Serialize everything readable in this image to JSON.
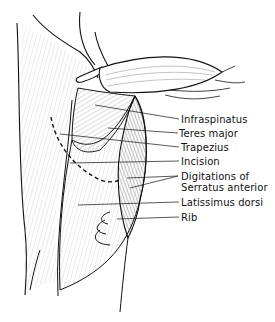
{
  "figure": {
    "labels": [
      {
        "id": "infraspinatus",
        "text": "Infraspinatus",
        "x": 181,
        "y": 114
      },
      {
        "id": "teres-major",
        "text": "Teres major",
        "x": 179,
        "y": 128
      },
      {
        "id": "trapezius",
        "text": "Trapezius",
        "x": 181,
        "y": 142
      },
      {
        "id": "incision",
        "text": "Incision",
        "x": 181,
        "y": 156
      },
      {
        "id": "digitations-1",
        "text": "Digitations of",
        "x": 181,
        "y": 171
      },
      {
        "id": "digitations-2",
        "text": "Serratus anterior",
        "x": 181,
        "y": 182
      },
      {
        "id": "latissimus",
        "text": "Latissimus dorsi",
        "x": 181,
        "y": 197
      },
      {
        "id": "rib",
        "text": "Rib",
        "x": 181,
        "y": 212
      }
    ]
  },
  "labels": {
    "infraspinatus": "Infraspinatus",
    "teres_major": "Teres major",
    "trapezius": "Trapezius",
    "incision": "Incision",
    "digitations_1": "Digitations of",
    "digitations_2": "Serratus anterior",
    "latissimus": "Latissimus dorsi",
    "rib": "Rib"
  },
  "colors": {
    "ink": "#111111",
    "background": "#ffffff",
    "hatch": "#9a9a9a"
  }
}
